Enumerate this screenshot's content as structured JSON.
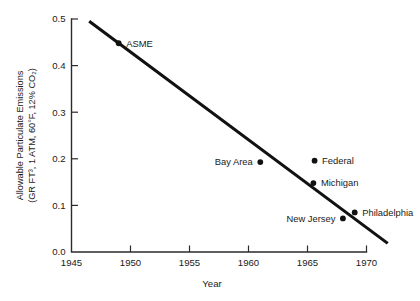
{
  "chart_data": {
    "type": "scatter",
    "title": "",
    "xlabel": "Year",
    "ylabel_line1": "Allowable Particulate Emissions",
    "ylabel_line2": "(GR FT³, 1 ATM, 60°F, 12% CO₂)",
    "xlim": [
      1945,
      1972
    ],
    "ylim": [
      0.0,
      0.5
    ],
    "xticks": [
      "1945",
      "1950",
      "1955",
      "1960",
      "1965",
      "1970"
    ],
    "xtick_values": [
      1945,
      1950,
      1955,
      1960,
      1965,
      1970
    ],
    "yticks": [
      "0.0",
      "0.1",
      "0.2",
      "0.3",
      "0.4",
      "0.5"
    ],
    "ytick_values": [
      0.0,
      0.1,
      0.2,
      0.3,
      0.4,
      0.5
    ],
    "grid": false,
    "legend": "none",
    "line_color": "#111111",
    "point_color": "#111111",
    "axis_color": "#2b2b2b",
    "trend_line": {
      "name": "regulation trend",
      "x": [
        1946.5,
        1971.8
      ],
      "y": [
        0.495,
        0.0185
      ]
    },
    "points": [
      {
        "label": "ASME",
        "x": 1949.0,
        "y": 0.448,
        "label_side": "right"
      },
      {
        "label": "Bay Area",
        "x": 1961.0,
        "y": 0.193,
        "label_side": "left"
      },
      {
        "label": "Federal",
        "x": 1965.6,
        "y": 0.196,
        "label_side": "right"
      },
      {
        "label": "Michigan",
        "x": 1965.5,
        "y": 0.148,
        "label_side": "right"
      },
      {
        "label": "New Jersey",
        "x": 1968.0,
        "y": 0.072,
        "label_side": "left"
      },
      {
        "label": "Philadelphia",
        "x": 1969.0,
        "y": 0.085,
        "label_side": "right"
      }
    ]
  }
}
